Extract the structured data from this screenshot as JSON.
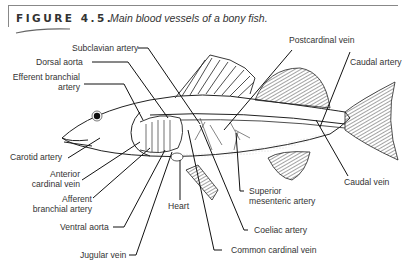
{
  "figure": {
    "number": "FIGURE 4.5.",
    "caption": "Main blood vessels of a bony fish."
  },
  "labels": {
    "subclavian_artery": "Subclavian artery",
    "dorsal_aorta": "Dorsal aorta",
    "efferent_branchial_artery_1": "Efferent branchial",
    "efferent_branchial_artery_2": "artery",
    "carotid_artery": "Carotid artery",
    "anterior_cardinal_vein_1": "Anterior",
    "anterior_cardinal_vein_2": "cardinal vein",
    "afferent_branchial_artery_1": "Afferent",
    "afferent_branchial_artery_2": "branchial artery",
    "ventral_aorta": "Ventral aorta",
    "jugular_vein": "Jugular vein",
    "heart": "Heart",
    "common_cardinal_vein": "Common cardinal vein",
    "coeliac_artery": "Coeliac artery",
    "superior_mesenteric_artery_1": "Superior",
    "superior_mesenteric_artery_2": "mesenteric artery",
    "postcardinal_vein": "Postcardinal vein",
    "caudal_artery": "Caudal artery",
    "caudal_vein": "Caudal vein"
  }
}
